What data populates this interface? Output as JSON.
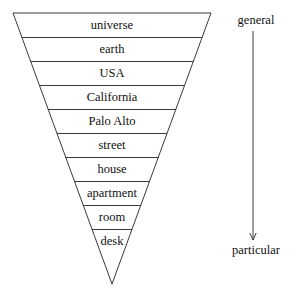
{
  "diagram": {
    "stroke_color": "#3a3a3a",
    "text_color": "#111111",
    "background_color": "#ffffff",
    "apex": {
      "x": 112,
      "y": 284
    },
    "top_left": {
      "x": 13,
      "y": 13
    },
    "top_right": {
      "x": 211,
      "y": 13
    },
    "levels": [
      {
        "label": "universe",
        "y_top": 13,
        "y_bottom": 37
      },
      {
        "label": "earth",
        "y_top": 37,
        "y_bottom": 61
      },
      {
        "label": "USA",
        "y_top": 61,
        "y_bottom": 85
      },
      {
        "label": "California",
        "y_top": 85,
        "y_bottom": 109
      },
      {
        "label": "Palo Alto",
        "y_top": 109,
        "y_bottom": 133
      },
      {
        "label": "street",
        "y_top": 133,
        "y_bottom": 157
      },
      {
        "label": "house",
        "y_top": 157,
        "y_bottom": 181
      },
      {
        "label": "apartment",
        "y_top": 181,
        "y_bottom": 205
      },
      {
        "label": "room",
        "y_top": 205,
        "y_bottom": 229
      },
      {
        "label": "desk",
        "y_top": 229,
        "y_bottom": 253
      }
    ]
  },
  "axis": {
    "top_label": "general",
    "bottom_label": "particular",
    "arrow_direction": "down",
    "arrow_x": 253,
    "arrow_y_start": 31,
    "arrow_y_end": 240
  }
}
